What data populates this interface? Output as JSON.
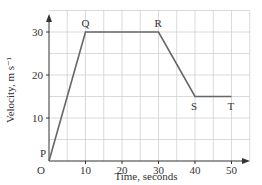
{
  "chart_data": {
    "type": "line",
    "title": "",
    "xlabel": "Time, seconds",
    "ylabel": "Velocity, m s⁻¹",
    "xlim": [
      0,
      55
    ],
    "ylim": [
      0,
      35
    ],
    "grid": true,
    "grid_step": 5,
    "xticks": [
      10,
      20,
      30,
      40,
      50
    ],
    "yticks": [
      10,
      20,
      30
    ],
    "x": [
      0,
      10,
      30,
      40,
      50
    ],
    "values": [
      0,
      30,
      30,
      15,
      15
    ],
    "point_labels": [
      "P",
      "Q",
      "R",
      "S",
      "T"
    ],
    "origin_label": "O",
    "legend": null
  }
}
